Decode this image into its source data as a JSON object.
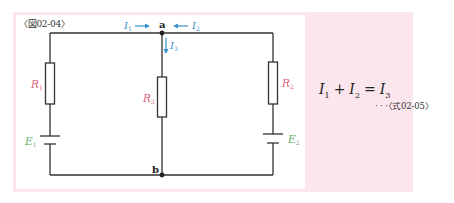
{
  "figure": {
    "label": "〈図02-04〉",
    "colors": {
      "background": "#ffffff",
      "panel": "#fbe6ee",
      "wire": "#333333",
      "current": "#3a8fd0",
      "resistor_label": "#e0607a",
      "emf_label": "#5fae6a"
    },
    "nodes": {
      "a": "a",
      "b": "b"
    },
    "currents": {
      "i1": {
        "symbol": "I",
        "sub": "1"
      },
      "i2": {
        "symbol": "I",
        "sub": "2"
      },
      "i3": {
        "symbol": "I",
        "sub": "3"
      }
    },
    "resistors": {
      "r1": {
        "symbol": "R",
        "sub": "1"
      },
      "r2": {
        "symbol": "R",
        "sub": "2"
      },
      "r3": {
        "symbol": "R",
        "sub": "3"
      }
    },
    "sources": {
      "e1": {
        "symbol": "E",
        "sub": "1"
      },
      "e2": {
        "symbol": "E",
        "sub": "2"
      }
    }
  },
  "equation": {
    "t1": "I",
    "t1_sub": "1",
    "plus": "+",
    "t2": "I",
    "t2_sub": "2",
    "equals": "=",
    "t3": "I",
    "t3_sub": "3",
    "ref": "· · ·〈式02-05〉"
  }
}
